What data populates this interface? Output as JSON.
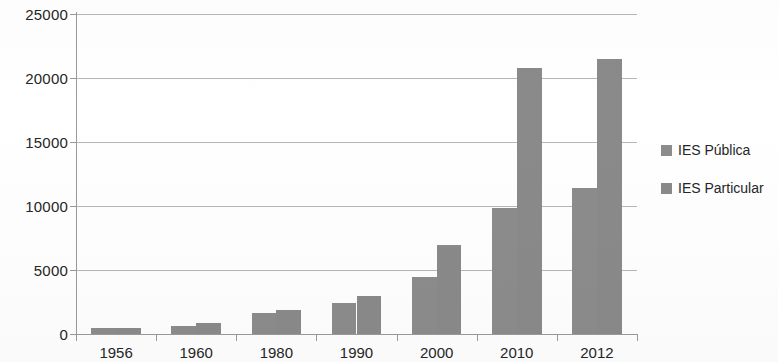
{
  "chart_data": {
    "type": "bar",
    "title": "",
    "subtitle": "",
    "xlabel": "",
    "ylabel": "",
    "categories": [
      "1956",
      "1960",
      "1980",
      "1990",
      "2000",
      "2010",
      "2012"
    ],
    "series": [
      {
        "name": "IES Pública",
        "color": "#8c8c8c",
        "values": [
          450,
          620,
          1640,
          2420,
          4450,
          9850,
          11400
        ]
      },
      {
        "name": "IES Particular",
        "color": "#8a8a8a",
        "values": [
          450,
          860,
          1880,
          2970,
          6950,
          20800,
          21500
        ]
      }
    ],
    "ylim": [
      0,
      25000
    ],
    "yticks": [
      0,
      5000,
      10000,
      15000,
      20000,
      25000
    ],
    "ytick_labels": [
      "0",
      "5000",
      "10000",
      "15000",
      "20000",
      "25000"
    ],
    "grid": true,
    "grid_axis": "y",
    "legend_position": "right",
    "bar_style": "grouped"
  },
  "legend": {
    "items": [
      {
        "label": "IES Pública"
      },
      {
        "label": "IES Particular"
      }
    ]
  }
}
